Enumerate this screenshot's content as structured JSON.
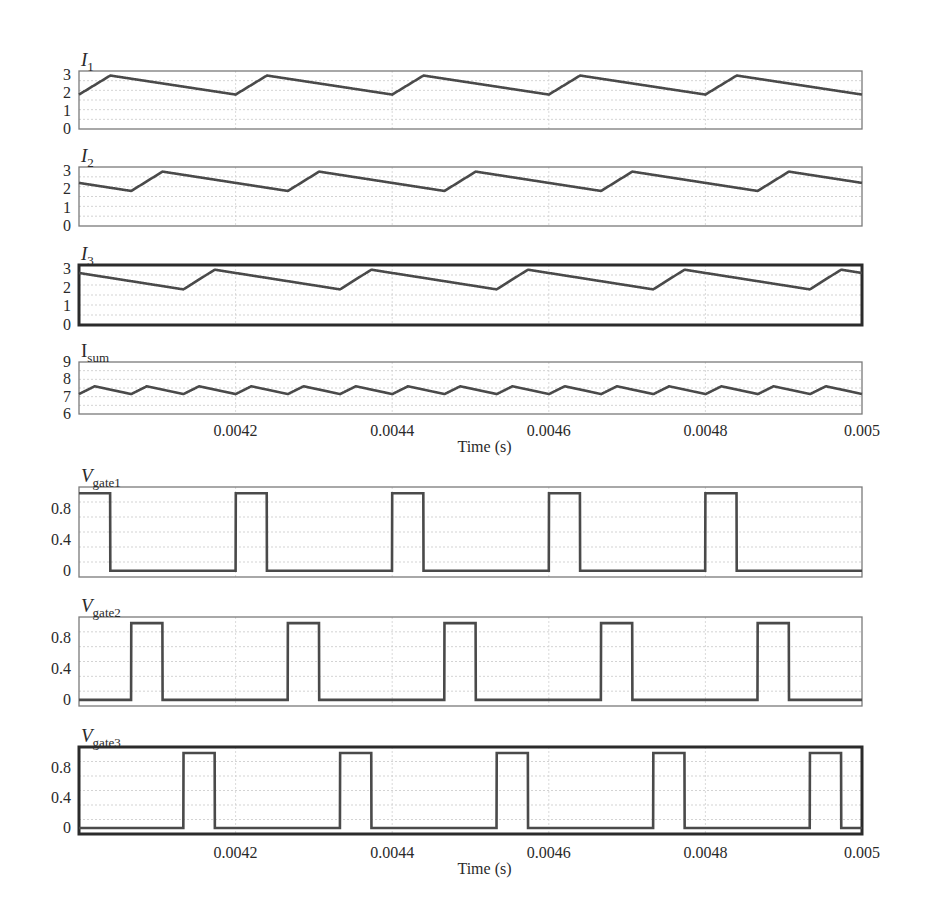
{
  "figure": {
    "xlabel": "Time (s)",
    "x_range": [
      0.004,
      0.005
    ],
    "x_ticks": [
      0.0042,
      0.0044,
      0.0046,
      0.0048,
      0.005
    ],
    "x_tick_labels": [
      "0.0042",
      "0.0044",
      "0.0046",
      "0.0048",
      "0.005"
    ]
  },
  "chart_data": [
    {
      "type": "line",
      "title": "I1",
      "label_main": "I",
      "label_sub": "1",
      "label_italic": true,
      "ylabel": "",
      "xlabel": "",
      "ylim": [
        0,
        3.2
      ],
      "y_ticks": [
        0,
        1,
        2,
        3
      ],
      "y_tick_labels": [
        "0",
        "1",
        "2",
        "3"
      ],
      "grid": true,
      "waveform": "ripple_current",
      "params": {
        "period": 0.0002,
        "on_time": 4e-05,
        "phase": 0.0,
        "min": 1.9,
        "max": 2.95
      },
      "x": [
        0.004,
        0.00404,
        0.0042,
        0.00424,
        0.0044,
        0.00444,
        0.0046,
        0.00464,
        0.0048,
        0.00484,
        0.005
      ],
      "values": [
        1.9,
        2.95,
        1.9,
        2.95,
        1.9,
        2.95,
        1.9,
        2.95,
        1.9,
        2.95,
        1.9
      ],
      "border": "normal"
    },
    {
      "type": "line",
      "title": "I2",
      "label_main": "I",
      "label_sub": "2",
      "label_italic": true,
      "ylim": [
        0,
        3.2
      ],
      "y_ticks": [
        0,
        1,
        2,
        3
      ],
      "y_tick_labels": [
        "0",
        "1",
        "2",
        "3"
      ],
      "grid": true,
      "waveform": "ripple_current",
      "params": {
        "period": 0.0002,
        "on_time": 4e-05,
        "phase": 6.67e-05,
        "min": 1.9,
        "max": 2.95
      },
      "x": [
        0.004,
        0.0040667,
        0.0041067,
        0.0042667,
        0.0043067,
        0.0044667,
        0.0045067,
        0.0046667,
        0.0047067,
        0.0048667,
        0.0049067,
        0.005
      ],
      "values": [
        2.3,
        1.9,
        2.95,
        1.9,
        2.95,
        1.9,
        2.95,
        1.9,
        2.95,
        1.9,
        2.95,
        2.55
      ],
      "border": "normal"
    },
    {
      "type": "line",
      "title": "I3",
      "label_main": "I",
      "label_sub": "3",
      "label_italic": true,
      "ylim": [
        0,
        3.2
      ],
      "y_ticks": [
        0,
        1,
        2,
        3
      ],
      "y_tick_labels": [
        "0",
        "1",
        "2",
        "3"
      ],
      "grid": true,
      "waveform": "ripple_current",
      "params": {
        "period": 0.0002,
        "on_time": 4e-05,
        "phase": 0.0001333,
        "min": 1.9,
        "max": 2.95
      },
      "x": [
        0.004,
        0.0041333,
        0.0041733,
        0.0043333,
        0.0043733,
        0.0045333,
        0.0045733,
        0.0047333,
        0.0047733,
        0.0049333,
        0.0049733,
        0.005
      ],
      "values": [
        2.6,
        1.9,
        2.95,
        1.9,
        2.95,
        1.9,
        2.95,
        1.9,
        2.95,
        1.9,
        2.95,
        2.85
      ],
      "border": "thick"
    },
    {
      "type": "line",
      "title": "Isum",
      "label_main": "I",
      "label_sub": "sum",
      "label_italic": false,
      "ylim": [
        6,
        9
      ],
      "y_ticks": [
        6,
        7,
        8,
        9
      ],
      "y_tick_labels": [
        "6",
        "7",
        "8",
        "9"
      ],
      "grid": true,
      "waveform": "sum_ripple",
      "params": {
        "period": 6.67e-05,
        "on_time": 2e-05,
        "phase": 0.0,
        "min": 7.15,
        "max": 7.6
      },
      "x": [
        0.004,
        0.00402,
        0.0040667,
        0.0040867,
        0.0041333,
        0.0041533,
        0.0042,
        0.00422
      ],
      "values": [
        7.15,
        7.6,
        7.15,
        7.6,
        7.15,
        7.6,
        7.15,
        7.6
      ],
      "border": "normal"
    },
    {
      "type": "line",
      "title": "Vgate1",
      "label_main": "V",
      "label_sub": "gate1",
      "label_italic": true,
      "ylim": [
        -0.08,
        1.08
      ],
      "y_ticks": [
        0,
        0.4,
        0.8
      ],
      "y_tick_labels": [
        "0",
        "0.4",
        "0.8"
      ],
      "grid": true,
      "waveform": "pulse",
      "params": {
        "period": 0.0002,
        "on_time": 4e-05,
        "phase": 0.0,
        "low": 0.0,
        "high": 1.0
      },
      "pulse_starts": [
        0.004,
        0.0042,
        0.0044,
        0.0046,
        0.0048,
        0.005
      ],
      "values_high": 1.0,
      "values_low": 0.0,
      "border": "normal",
      "show_xaxis": false
    },
    {
      "type": "line",
      "title": "Vgate2",
      "label_main": "V",
      "label_sub": "gate2",
      "label_italic": true,
      "ylim": [
        -0.08,
        1.08
      ],
      "y_ticks": [
        0,
        0.4,
        0.8
      ],
      "y_tick_labels": [
        "0",
        "0.4",
        "0.8"
      ],
      "grid": true,
      "waveform": "pulse",
      "params": {
        "period": 0.0002,
        "on_time": 4e-05,
        "phase": 6.67e-05,
        "low": 0.0,
        "high": 1.0
      },
      "pulse_starts": [
        0.0040667,
        0.0042667,
        0.0044667,
        0.0046667,
        0.0048667
      ],
      "values_high": 1.0,
      "values_low": 0.0,
      "border": "normal",
      "show_xaxis": false
    },
    {
      "type": "line",
      "title": "Vgate3",
      "label_main": "V",
      "label_sub": "gate3",
      "label_italic": true,
      "ylim": [
        -0.08,
        1.08
      ],
      "y_ticks": [
        0,
        0.4,
        0.8
      ],
      "y_tick_labels": [
        "0",
        "0.4",
        "0.8"
      ],
      "grid": true,
      "waveform": "pulse",
      "params": {
        "period": 0.0002,
        "on_time": 4e-05,
        "phase": 0.0001333,
        "low": 0.0,
        "high": 1.0
      },
      "pulse_starts": [
        0.0041333,
        0.0043333,
        0.0045333,
        0.0047333,
        0.0049333
      ],
      "values_high": 1.0,
      "values_low": 0.0,
      "border": "thick",
      "show_xaxis": true
    }
  ],
  "layout": {
    "plot_left": 79,
    "plot_right": 862,
    "panels": [
      {
        "top": 71,
        "bottom": 129,
        "label_y": 58,
        "axis_labels_below": false
      },
      {
        "top": 167,
        "bottom": 226,
        "label_y": 154,
        "axis_labels_below": false
      },
      {
        "top": 265,
        "bottom": 325,
        "label_y": 252,
        "axis_labels_below": false
      },
      {
        "top": 362,
        "bottom": 414,
        "label_y": 349,
        "axis_labels_below": true,
        "tick_label_y": 436,
        "xlabel_y": 452
      },
      {
        "top": 487,
        "bottom": 577,
        "label_y": 474,
        "axis_labels_below": false
      },
      {
        "top": 617,
        "bottom": 706,
        "label_y": 604,
        "axis_labels_below": false
      },
      {
        "top": 747,
        "bottom": 834,
        "label_y": 734,
        "axis_labels_below": true,
        "tick_label_y": 858,
        "xlabel_y": 874
      }
    ]
  }
}
